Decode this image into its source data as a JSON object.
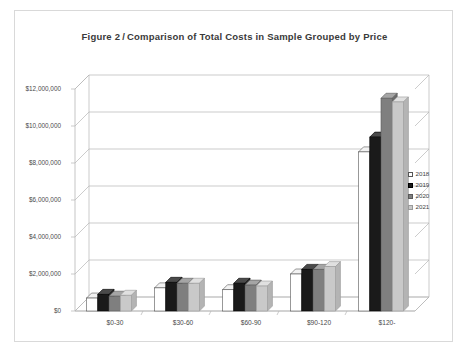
{
  "figure": {
    "label": "Figure 2",
    "separator": "/",
    "title": "Comparison of Total Costs in Sample Grouped by Price"
  },
  "legend": {
    "position": "right",
    "entries": [
      {
        "name": "2018",
        "color": "#ffffff",
        "stroke": "#555555"
      },
      {
        "name": "2019",
        "color": "#1a1a1a",
        "stroke": "#000000"
      },
      {
        "name": "2020",
        "color": "#7f7f7f",
        "stroke": "#5a5a5a"
      },
      {
        "name": "2021",
        "color": "#c9c9c9",
        "stroke": "#9a9a9a"
      }
    ]
  },
  "chart_data": {
    "type": "bar",
    "xlabel": "",
    "ylabel": "",
    "categories": [
      "$0-30",
      "$30-60",
      "$60-90",
      "$90-120",
      "$120-"
    ],
    "series": [
      {
        "name": "2018",
        "values": [
          700000,
          1250000,
          1150000,
          2000000,
          8600000
        ]
      },
      {
        "name": "2019",
        "values": [
          900000,
          1550000,
          1500000,
          2250000,
          9400000
        ]
      },
      {
        "name": "2020",
        "values": [
          800000,
          1500000,
          1400000,
          2250000,
          11500000
        ]
      },
      {
        "name": "2021",
        "values": [
          850000,
          1500000,
          1350000,
          2400000,
          11300000
        ]
      }
    ],
    "ylim": [
      0,
      12000000
    ],
    "ytick_values": [
      0,
      2000000,
      4000000,
      6000000,
      8000000,
      10000000,
      12000000
    ],
    "ytick_labels": [
      "$0",
      "$2,000,000",
      "$4,000,000",
      "$6,000,000",
      "$8,000,000",
      "$10,000,000",
      "$12,000,000"
    ],
    "grid": true,
    "grid_axis": "y",
    "three_d": true,
    "legend_position": "right"
  }
}
